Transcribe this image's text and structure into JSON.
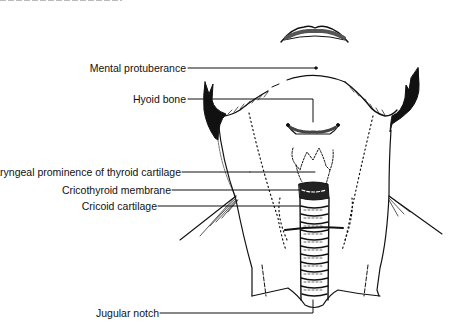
{
  "figure": {
    "labels": [
      {
        "id": "mental-protuberance",
        "text": "Mental protuberance"
      },
      {
        "id": "hyoid-bone",
        "text": "Hyoid bone"
      },
      {
        "id": "laryngeal-prominence",
        "text": "Laryngeal prominence of thyroid cartilage"
      },
      {
        "id": "cricothyroid-membrane",
        "text": "Cricothyroid membrane"
      },
      {
        "id": "cricoid-cartilage",
        "text": "Cricoid cartilage"
      },
      {
        "id": "jugular-notch",
        "text": "Jugular notch"
      }
    ],
    "colors": {
      "ink": "#111111",
      "background": "#ffffff"
    }
  }
}
